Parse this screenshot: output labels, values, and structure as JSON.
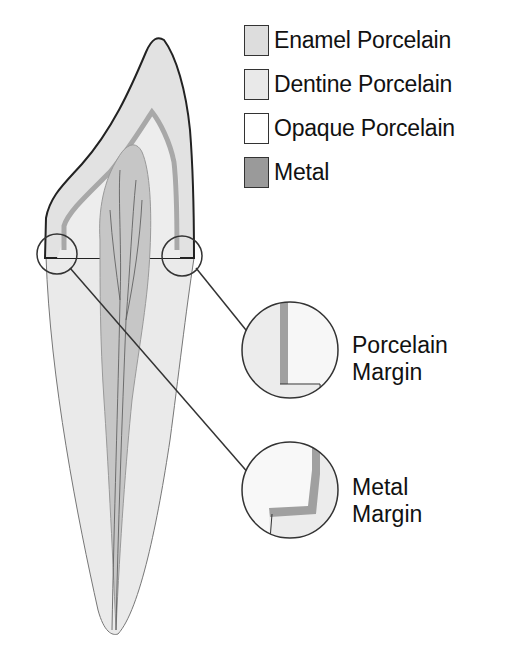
{
  "legend": {
    "items": [
      {
        "label": "Enamel Porcelain",
        "color": "#dddddd"
      },
      {
        "label": "Dentine Porcelain",
        "color": "#e9e9e9"
      },
      {
        "label": "Opaque Porcelain",
        "color": "#ffffff"
      },
      {
        "label": "Metal",
        "color": "#9a9a9a"
      }
    ]
  },
  "callouts": {
    "porcelain_margin": {
      "line1": "Porcelain",
      "line2": "Margin"
    },
    "metal_margin": {
      "line1": "Metal",
      "line2": "Margin"
    }
  },
  "colors": {
    "outline": "#222222",
    "enamel": "#e4e4e4",
    "dentine": "#ececec",
    "opaque": "#f8f8f8",
    "metal": "#a0a0a0",
    "pulp": "#c4c4c4",
    "root": "#eaeaea"
  }
}
